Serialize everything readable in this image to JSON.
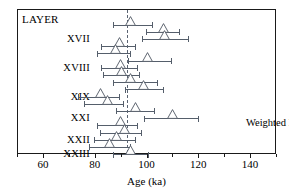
{
  "chart_data": {
    "type": "scatter",
    "title": "",
    "xlabel": "Age (ka)",
    "ylabel": "LAYER",
    "xlim": [
      50,
      150
    ],
    "xticks": [
      60,
      80,
      100,
      120,
      140
    ],
    "xticklabels": [
      "60",
      "80",
      "100",
      "120",
      "140"
    ],
    "minor_xticks": [
      50,
      70,
      90,
      110,
      130,
      150
    ],
    "grid": false,
    "legend": null,
    "annotations": [
      {
        "name": "weighted-mean-annotation",
        "text": "Weighted Mean: 92 ± 5 ka",
        "x": 138,
        "y_row": 14
      }
    ],
    "reference_lines": [
      {
        "name": "weighted-mean-line",
        "orientation": "vertical",
        "value": 92,
        "style": "dashed",
        "color": "#5b6472"
      }
    ],
    "category_axis_label": "LAYER",
    "categories": [
      "XVII",
      "XVIII",
      "XIX",
      "XXI",
      "XXII",
      "XXIII"
    ],
    "points": [
      {
        "row": 0,
        "age": 93.5,
        "err_low": 86.5,
        "err_high": 102.0
      },
      {
        "row": 1,
        "age": 106.0,
        "err_low": 99.5,
        "err_high": 112.5
      },
      {
        "row": 2,
        "age": 106.5,
        "err_low": 98.0,
        "err_high": 116.0
      },
      {
        "row": 3,
        "age": 89.0,
        "err_low": 82.0,
        "err_high": 95.5
      },
      {
        "row": 4,
        "age": 87.5,
        "err_low": 80.5,
        "err_high": 93.5
      },
      {
        "row": 5,
        "age": 100.0,
        "err_low": 92.5,
        "err_high": 109.5
      },
      {
        "row": 6,
        "age": 89.5,
        "err_low": 82.0,
        "err_high": 96.5
      },
      {
        "row": 7,
        "age": 90.0,
        "err_low": 83.0,
        "err_high": 97.0
      },
      {
        "row": 8,
        "age": 93.5,
        "err_low": 86.5,
        "err_high": 104.0
      },
      {
        "row": 9,
        "age": 98.5,
        "err_low": 91.5,
        "err_high": 106.5
      },
      {
        "row": 10,
        "age": 82.0,
        "err_low": 73.0,
        "err_high": 89.5
      },
      {
        "row": 11,
        "age": 84.5,
        "err_low": 75.5,
        "err_high": 91.0
      },
      {
        "row": 12,
        "age": 95.5,
        "err_low": 88.0,
        "err_high": 103.0
      },
      {
        "row": 13,
        "age": 109.5,
        "err_low": 98.5,
        "err_high": 120.0
      },
      {
        "row": 14,
        "age": 89.5,
        "err_low": 80.5,
        "err_high": 96.5
      },
      {
        "row": 15,
        "age": 91.0,
        "err_low": 81.5,
        "err_high": 98.0
      },
      {
        "row": 16,
        "age": 88.0,
        "err_low": 79.5,
        "err_high": 95.5
      },
      {
        "row": 17,
        "age": 85.5,
        "err_low": 77.5,
        "err_high": 93.5
      },
      {
        "row": 18,
        "age": 93.5,
        "err_low": 86.5,
        "err_high": 100.5
      }
    ],
    "marker": {
      "shape": "triangle-up",
      "facecolor": "#ffffff",
      "edgecolor": "#4e5662"
    },
    "errorbar_color": "#555e6b",
    "frame_color": "#1a1a1a"
  },
  "layout": {
    "row_pitch": 7.2,
    "row_top": 14.5,
    "label_rows": {
      "XVII": 2,
      "XVIII": 6,
      "XIX": 10,
      "XXI": 13,
      "XXII": 16,
      "XXIII": 18
    }
  }
}
